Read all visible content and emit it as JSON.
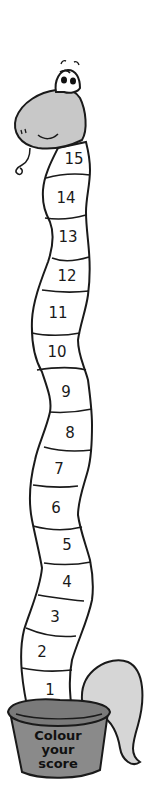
{
  "worksheet": {
    "title": "Colour your score",
    "pot_label_lines": [
      "Colour",
      "your",
      "score"
    ],
    "segments": [
      {
        "number": "15",
        "top": 142,
        "bottom": 175,
        "cx": 73
      },
      {
        "number": "14",
        "top": 175,
        "bottom": 215,
        "cx": 65
      },
      {
        "number": "13",
        "top": 215,
        "bottom": 257,
        "cx": 68
      },
      {
        "number": "12",
        "top": 257,
        "bottom": 293,
        "cx": 67
      },
      {
        "number": "11",
        "top": 293,
        "bottom": 333,
        "cx": 57
      },
      {
        "number": "10",
        "top": 333,
        "bottom": 373,
        "cx": 58
      },
      {
        "number": "9",
        "top": 373,
        "bottom": 412,
        "cx": 66
      },
      {
        "number": "8",
        "top": 412,
        "bottom": 451,
        "cx": 70
      },
      {
        "number": "7",
        "top": 451,
        "bottom": 488,
        "cx": 59
      },
      {
        "number": "6",
        "top": 488,
        "bottom": 527,
        "cx": 56
      },
      {
        "number": "5",
        "top": 527,
        "bottom": 565,
        "cx": 67
      },
      {
        "number": "4",
        "top": 565,
        "bottom": 602,
        "cx": 67
      },
      {
        "number": "3",
        "top": 602,
        "bottom": 639,
        "cx": 56
      },
      {
        "number": "2",
        "top": 639,
        "bottom": 675,
        "cx": 42
      },
      {
        "number": "1",
        "top": 675,
        "bottom": 712,
        "cx": 50
      }
    ],
    "colors": {
      "outline": "#1a1a1a",
      "head_fill": "#c8c8c8",
      "body_fill": "#ffffff",
      "pot_fill": "#8a8a8a",
      "pot_rim": "#7a7a7a",
      "tail_fill": "#d6d6d6"
    }
  }
}
